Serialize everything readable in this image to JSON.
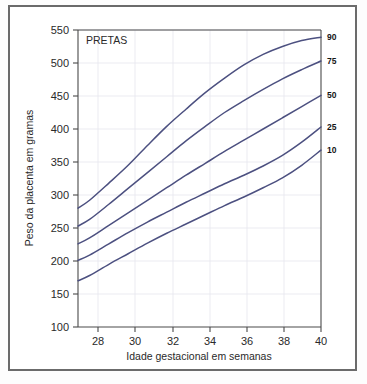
{
  "figure": {
    "annotation": "PRETAS",
    "background_color": "#ffffff",
    "frame_color": "#6b6b6b",
    "curve_color": "#4c5080",
    "grid_color": "#e9e9ef"
  },
  "chart_data": {
    "type": "line",
    "title": "",
    "annotation": "PRETAS",
    "xlabel": "Idade gestacional em semanas",
    "ylabel": "Peso da placenta em gramas",
    "xlim": [
      27.4,
      40
    ],
    "ylim": [
      100,
      550
    ],
    "xticks": [
      28,
      30,
      32,
      34,
      36,
      38,
      40
    ],
    "xtick_labels": [
      "28",
      "30",
      "32",
      "34",
      "36",
      "38",
      "40"
    ],
    "yticks": [
      100,
      150,
      200,
      250,
      300,
      350,
      400,
      450,
      500,
      550
    ],
    "ytick_labels": [
      "100",
      "150",
      "200",
      "250",
      "300",
      "350",
      "400",
      "450",
      "500",
      "550"
    ],
    "grid": true,
    "legend_position": "right-axis-labels",
    "x": [
      27.4,
      28,
      29,
      30,
      31,
      32,
      33,
      34,
      35,
      36,
      37,
      38,
      39,
      40
    ],
    "series": [
      {
        "name": "90",
        "label": "90",
        "values": [
          280,
          292,
          318,
          345,
          375,
          404,
          430,
          455,
          477,
          497,
          513,
          525,
          534,
          539
        ]
      },
      {
        "name": "75",
        "label": "75",
        "values": [
          253,
          263,
          286,
          310,
          334,
          358,
          382,
          404,
          425,
          443,
          460,
          476,
          490,
          503
        ]
      },
      {
        "name": "50",
        "label": "50",
        "values": [
          226,
          235,
          254,
          273,
          292,
          311,
          330,
          348,
          366,
          383,
          400,
          417,
          434,
          451
        ]
      },
      {
        "name": "25",
        "label": "25",
        "values": [
          201,
          209,
          226,
          243,
          259,
          274,
          289,
          303,
          317,
          330,
          344,
          360,
          380,
          403
        ]
      },
      {
        "name": "10",
        "label": "10",
        "values": [
          170,
          178,
          195,
          211,
          227,
          242,
          256,
          270,
          284,
          297,
          311,
          326,
          345,
          368
        ]
      }
    ]
  }
}
